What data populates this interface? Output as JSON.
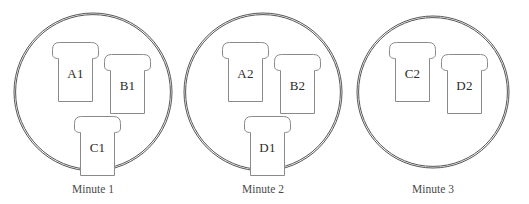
{
  "diagram": {
    "type": "set-diagram",
    "colors": {
      "background": "#ffffff",
      "circle_stroke": "#555555",
      "shape_stroke": "#8a8a8a",
      "shape_fill": "#ffffff",
      "label_text": "#2b2b2b",
      "caption_text": "#4a4a4a"
    },
    "groups": [
      {
        "id": "group-1",
        "caption": "Minute 1",
        "circle": {
          "cx": 93,
          "cy": 92,
          "r": 79
        },
        "caption_pos": {
          "x": 93,
          "y": 184
        },
        "items": [
          {
            "id": "a1",
            "label": "A1",
            "x": 52,
            "y": 42,
            "w": 47,
            "h": 60
          },
          {
            "id": "b1",
            "label": "B1",
            "x": 104,
            "y": 54,
            "w": 47,
            "h": 60
          },
          {
            "id": "c1",
            "label": "C1",
            "x": 74,
            "y": 116,
            "w": 47,
            "h": 60
          }
        ]
      },
      {
        "id": "group-2",
        "caption": "Minute 2",
        "circle": {
          "cx": 263,
          "cy": 92,
          "r": 79
        },
        "caption_pos": {
          "x": 263,
          "y": 184
        },
        "items": [
          {
            "id": "a2",
            "label": "A2",
            "x": 222,
            "y": 42,
            "w": 47,
            "h": 60
          },
          {
            "id": "b2",
            "label": "B2",
            "x": 274,
            "y": 54,
            "w": 47,
            "h": 60
          },
          {
            "id": "d1",
            "label": "D1",
            "x": 244,
            "y": 116,
            "w": 47,
            "h": 60
          }
        ]
      },
      {
        "id": "group-3",
        "caption": "Minute 3",
        "circle": {
          "cx": 433,
          "cy": 92,
          "r": 76
        },
        "caption_pos": {
          "x": 433,
          "y": 184
        },
        "items": [
          {
            "id": "c2",
            "label": "C2",
            "x": 389,
            "y": 42,
            "w": 47,
            "h": 60
          },
          {
            "id": "d2",
            "label": "D2",
            "x": 441,
            "y": 54,
            "w": 47,
            "h": 60
          }
        ]
      }
    ]
  }
}
